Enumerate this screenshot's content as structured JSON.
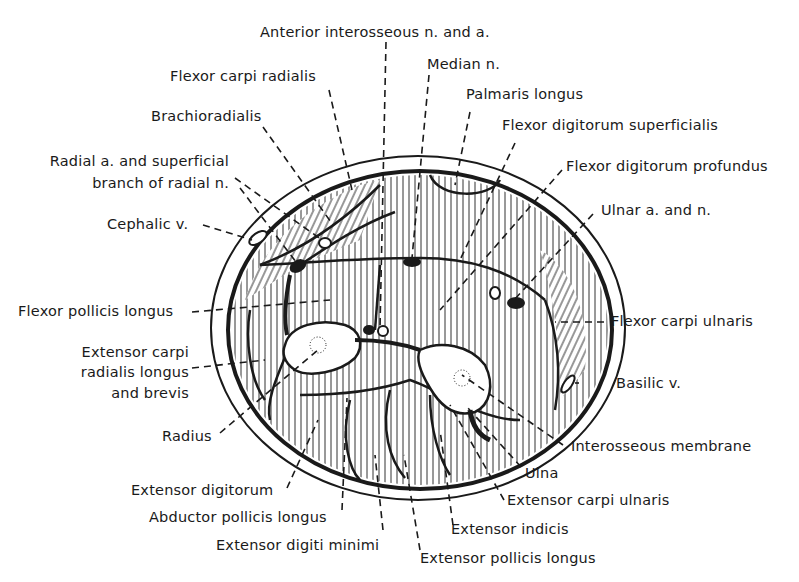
{
  "figure": {
    "colors": {
      "ink": "#1a1a1a",
      "background": "#ffffff"
    }
  },
  "labels": {
    "anterior_interosseous": "Anterior interosseous n. and a.",
    "flexor_carpi_radialis": "Flexor carpi radialis",
    "median_n": "Median n.",
    "palmaris_longus": "Palmaris longus",
    "brachioradialis": "Brachioradialis",
    "flexor_digitorum_superficialis": "Flexor digitorum superficialis",
    "radial_a_line1": "Radial a. and superficial",
    "radial_a_line2": "branch of radial n.",
    "flexor_digitorum_profundus": "Flexor digitorum profundus",
    "ulnar_a_n": "Ulnar a. and n.",
    "cephalic_v": "Cephalic v.",
    "flexor_pollicis_longus": "Flexor pollicis longus",
    "flexor_carpi_ulnaris": "Flexor carpi ulnaris",
    "ecrl_line1": "Extensor carpi",
    "ecrl_line2": "radialis longus",
    "ecrl_line3": "and brevis",
    "basilic_v": "Basilic v.",
    "radius": "Radius",
    "interosseous_membrane": "Interosseous membrane",
    "ulna": "Ulna",
    "extensor_digitorum": "Extensor digitorum",
    "extensor_carpi_ulnaris": "Extensor carpi ulnaris",
    "abductor_pollicis_longus": "Abductor pollicis longus",
    "extensor_indicis": "Extensor indicis",
    "extensor_digiti_minimi": "Extensor digiti minimi",
    "extensor_pollicis_longus": "Extensor pollicis longus"
  }
}
